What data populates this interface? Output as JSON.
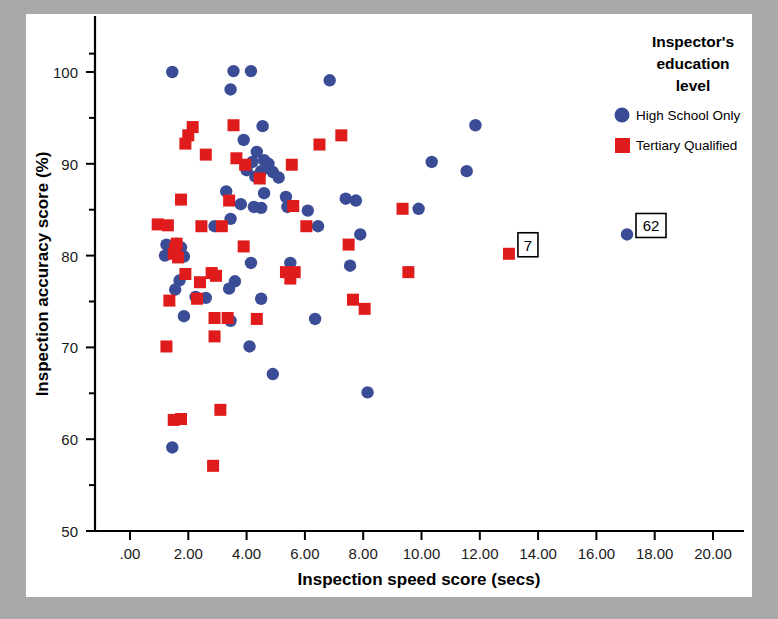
{
  "chart_data": {
    "type": "scatter",
    "title": "",
    "xlabel": "Inspection speed score (secs)",
    "ylabel": "Inspection accuracy score (%)",
    "xlim": [
      -0.6,
      21.2
    ],
    "ylim": [
      50,
      102.5
    ],
    "xticks": [
      ".00",
      "2.00",
      "4.00",
      "6.00",
      "8.00",
      "10.00",
      "12.00",
      "14.00",
      "16.00",
      "18.00",
      "20.00"
    ],
    "xtick_values": [
      0,
      2,
      4,
      6,
      8,
      10,
      12,
      14,
      16,
      18,
      20
    ],
    "yticks": [
      "50",
      "60",
      "70",
      "80",
      "90",
      "100"
    ],
    "ytick_values": [
      50,
      60,
      70,
      80,
      90,
      100
    ],
    "yminor_values": [
      55,
      65,
      75,
      85,
      95,
      102
    ],
    "grid": false,
    "legend_position": "top-right",
    "legend": {
      "title_lines": [
        "Inspector's",
        "education",
        "level"
      ],
      "entries": [
        {
          "name": "High School Only",
          "marker": "circle",
          "color": "#3b4c96"
        },
        {
          "name": "Tertiary Qualified",
          "marker": "square",
          "color": "#e01b1b"
        }
      ]
    },
    "annotations": [
      {
        "text": "7",
        "x": 13.0,
        "y": 80.2,
        "box": true
      },
      {
        "text": "62",
        "x": 17.05,
        "y": 82.3,
        "box": true
      }
    ],
    "series": [
      {
        "name": "High School Only",
        "marker": "circle",
        "color": "#3b4c96",
        "points": [
          [
            1.45,
            100.0
          ],
          [
            3.55,
            100.1
          ],
          [
            4.15,
            100.1
          ],
          [
            3.45,
            98.1
          ],
          [
            6.85,
            99.1
          ],
          [
            11.85,
            94.2
          ],
          [
            4.55,
            94.1
          ],
          [
            3.9,
            92.6
          ],
          [
            4.35,
            91.3
          ],
          [
            4.6,
            90.4
          ],
          [
            4.2,
            90.2
          ],
          [
            4.75,
            90.0
          ],
          [
            10.35,
            90.2
          ],
          [
            11.55,
            89.2
          ],
          [
            4.5,
            89.2
          ],
          [
            4.9,
            89.1
          ],
          [
            4.0,
            89.3
          ],
          [
            4.3,
            88.6
          ],
          [
            5.1,
            88.5
          ],
          [
            3.3,
            87.0
          ],
          [
            4.6,
            86.8
          ],
          [
            5.35,
            86.4
          ],
          [
            7.4,
            86.2
          ],
          [
            7.75,
            86.0
          ],
          [
            3.8,
            85.6
          ],
          [
            4.25,
            85.3
          ],
          [
            5.4,
            85.3
          ],
          [
            4.5,
            85.2
          ],
          [
            9.9,
            85.1
          ],
          [
            6.1,
            84.9
          ],
          [
            3.45,
            84.0
          ],
          [
            2.9,
            83.2
          ],
          [
            6.45,
            83.2
          ],
          [
            7.9,
            82.3
          ],
          [
            17.05,
            82.3
          ],
          [
            1.25,
            81.2
          ],
          [
            1.6,
            81.3
          ],
          [
            1.75,
            80.9
          ],
          [
            1.5,
            80.4
          ],
          [
            1.2,
            80.0
          ],
          [
            1.85,
            79.9
          ],
          [
            4.15,
            79.2
          ],
          [
            5.5,
            79.2
          ],
          [
            7.55,
            78.9
          ],
          [
            1.7,
            77.3
          ],
          [
            3.6,
            77.2
          ],
          [
            3.4,
            76.4
          ],
          [
            1.55,
            76.3
          ],
          [
            2.25,
            75.5
          ],
          [
            2.6,
            75.4
          ],
          [
            4.5,
            75.3
          ],
          [
            1.85,
            73.4
          ],
          [
            6.35,
            73.1
          ],
          [
            3.45,
            72.9
          ],
          [
            4.1,
            70.1
          ],
          [
            4.9,
            67.1
          ],
          [
            8.15,
            65.1
          ],
          [
            1.45,
            59.1
          ]
        ]
      },
      {
        "name": "Tertiary Qualified",
        "marker": "square",
        "color": "#e01b1b",
        "points": [
          [
            2.15,
            94.0
          ],
          [
            3.55,
            94.2
          ],
          [
            2.0,
            93.1
          ],
          [
            7.25,
            93.1
          ],
          [
            1.9,
            92.2
          ],
          [
            2.6,
            91.0
          ],
          [
            6.5,
            92.1
          ],
          [
            3.65,
            90.6
          ],
          [
            3.95,
            89.9
          ],
          [
            5.55,
            89.9
          ],
          [
            4.45,
            88.4
          ],
          [
            1.75,
            86.1
          ],
          [
            3.4,
            86.0
          ],
          [
            5.6,
            85.4
          ],
          [
            9.35,
            85.1
          ],
          [
            0.95,
            83.4
          ],
          [
            1.3,
            83.3
          ],
          [
            2.45,
            83.2
          ],
          [
            3.15,
            83.2
          ],
          [
            6.05,
            83.2
          ],
          [
            7.5,
            81.2
          ],
          [
            3.9,
            81.0
          ],
          [
            1.6,
            81.3
          ],
          [
            1.55,
            80.8
          ],
          [
            1.5,
            80.2
          ],
          [
            1.65,
            79.8
          ],
          [
            13.0,
            80.2
          ],
          [
            1.9,
            78.0
          ],
          [
            2.8,
            78.1
          ],
          [
            2.95,
            77.8
          ],
          [
            5.35,
            78.2
          ],
          [
            5.65,
            78.2
          ],
          [
            5.5,
            77.5
          ],
          [
            9.55,
            78.2
          ],
          [
            2.4,
            77.1
          ],
          [
            2.3,
            75.3
          ],
          [
            1.35,
            75.1
          ],
          [
            7.65,
            75.2
          ],
          [
            2.9,
            73.2
          ],
          [
            3.35,
            73.2
          ],
          [
            4.35,
            73.1
          ],
          [
            8.05,
            74.2
          ],
          [
            1.25,
            70.1
          ],
          [
            2.9,
            71.2
          ],
          [
            3.1,
            63.2
          ],
          [
            1.5,
            62.1
          ],
          [
            1.75,
            62.2
          ],
          [
            2.85,
            57.1
          ]
        ]
      }
    ]
  },
  "figure": {
    "tick_format_note": "",
    "axis_color": "#000000"
  }
}
